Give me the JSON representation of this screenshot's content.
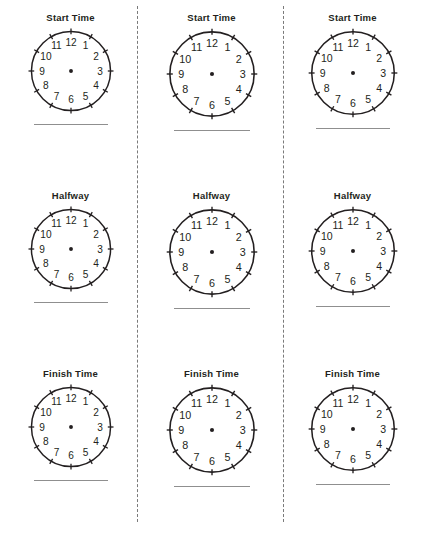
{
  "worksheet": {
    "title": "Blank Clock Faces Worksheet",
    "columns": 3,
    "rows": 3,
    "separator": "dashed-vertical-rule"
  },
  "clock": {
    "numerals": [
      "12",
      "1",
      "2",
      "3",
      "4",
      "5",
      "6",
      "7",
      "8",
      "9",
      "10",
      "11"
    ],
    "center_dot": "clock-center-dot",
    "hour_hand": "",
    "minute_hand": "",
    "tick_count": 12,
    "face_color": "#ffffff",
    "outline_color": "#231f20"
  },
  "answer_line": {
    "label": "",
    "color": "#8f8f8f"
  },
  "rows": [
    {
      "label": "Start Time",
      "cells": [
        {
          "label": "Start Time",
          "answer": ""
        },
        {
          "label": "Start Time",
          "answer": ""
        },
        {
          "label": "Start Time",
          "answer": ""
        }
      ]
    },
    {
      "label": "Halfway",
      "cells": [
        {
          "label": "Halfway",
          "answer": ""
        },
        {
          "label": "Halfway",
          "answer": ""
        },
        {
          "label": "Halfway",
          "answer": ""
        }
      ]
    },
    {
      "label": "Finish Time",
      "cells": [
        {
          "label": "Finish Time",
          "answer": ""
        },
        {
          "label": "Finish Time",
          "answer": ""
        },
        {
          "label": "Finish Time",
          "answer": ""
        }
      ]
    }
  ]
}
